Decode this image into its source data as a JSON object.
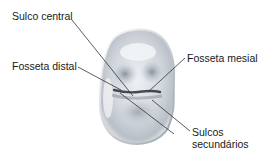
{
  "figure": {
    "labels": {
      "sulco_central": "Sulco central",
      "fosseta_distal": "Fosseta distal",
      "fosseta_mesial": "Fosseta mesial",
      "sulcos_secundarios_line1": "Sulcos",
      "sulcos_secundarios_line2": "secundários"
    },
    "colors": {
      "leader_line": "#333333",
      "enamel_light": "#f4f6f8",
      "enamel_mid": "#c9ced4",
      "enamel_dark": "#6e7682",
      "groove": "#2b2f36"
    }
  }
}
